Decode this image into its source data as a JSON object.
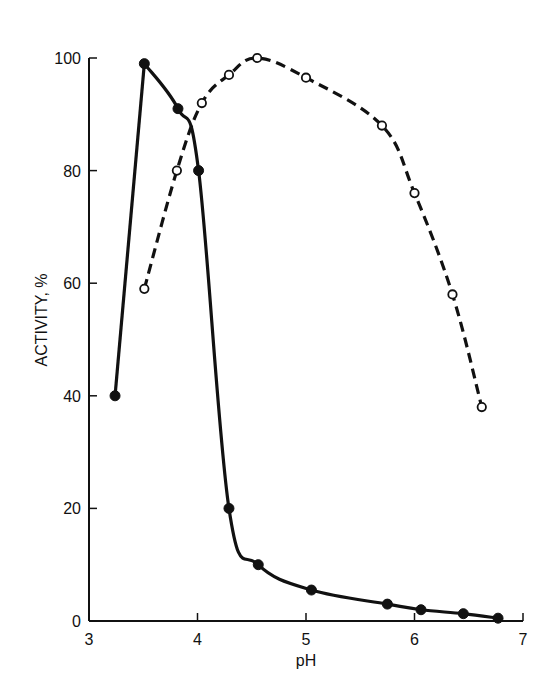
{
  "chart_data": {
    "type": "line",
    "title": "",
    "xlabel": "pH",
    "ylabel": "ACTIVITY, %",
    "xlim": [
      3,
      7
    ],
    "ylim": [
      0,
      100
    ],
    "x_ticks": [
      3,
      4,
      5,
      6,
      7
    ],
    "y_ticks": [
      0,
      20,
      40,
      60,
      80,
      100
    ],
    "grid": false,
    "legend": null,
    "series": [
      {
        "name": "solid-filled",
        "line_style": "solid",
        "marker": "filled-circle",
        "x": [
          3.24,
          3.51,
          3.82,
          4.01,
          4.29,
          4.56,
          5.05,
          5.75,
          6.06,
          6.45,
          6.77
        ],
        "y": [
          40,
          99,
          91,
          80,
          20,
          10,
          5.5,
          3,
          2,
          1.3,
          0.5
        ]
      },
      {
        "name": "dashed-open",
        "line_style": "dashed",
        "marker": "open-circle",
        "x": [
          3.51,
          3.81,
          4.04,
          4.29,
          4.55,
          5.0,
          5.7,
          6.0,
          6.35,
          6.62
        ],
        "y": [
          59,
          80,
          92,
          97,
          100,
          96.5,
          88,
          76,
          58,
          38
        ]
      }
    ]
  },
  "axes": {
    "x_label": "pH",
    "y_label": "ACTIVITY, %",
    "x_tick_labels": [
      "3",
      "4",
      "5",
      "6",
      "7"
    ],
    "y_tick_labels": [
      "0",
      "20",
      "40",
      "60",
      "80",
      "100"
    ]
  }
}
